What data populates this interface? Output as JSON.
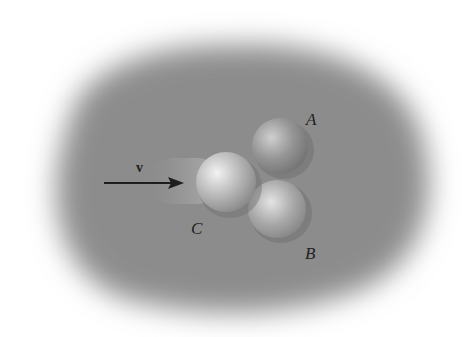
{
  "figure": {
    "labels": {
      "velocity": "v",
      "ball_a": "A",
      "ball_b": "B",
      "ball_c": "C"
    },
    "colors": {
      "table": "#8a8a8a",
      "table_edge": "#ffffff",
      "ball_highlight": "#e6e6e6",
      "ball_shadow": "#7a7a7a",
      "arrow": "#1e1e1e"
    }
  }
}
